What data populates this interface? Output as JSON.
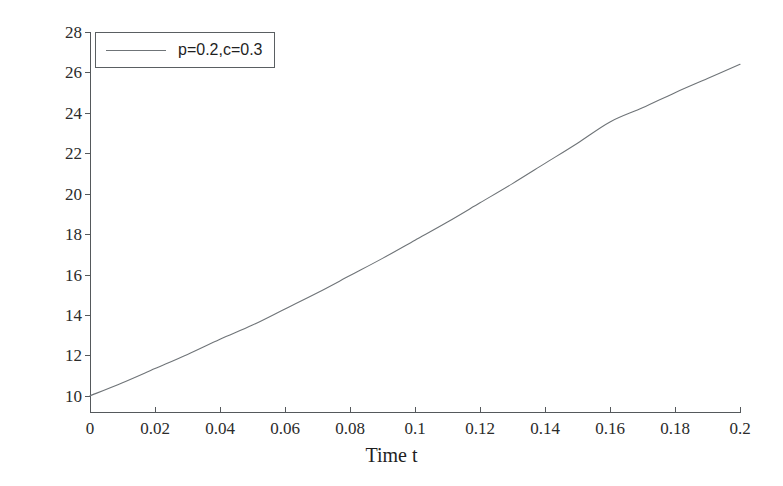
{
  "chart_data": {
    "type": "line",
    "title": "",
    "xlabel": "Time t",
    "ylabel": "Reputation Query",
    "xlim": [
      0,
      0.2
    ],
    "ylim": [
      9.2,
      28
    ],
    "xticks": [
      "0",
      "0.02",
      "0.04",
      "0.06",
      "0.08",
      "0.1",
      "0.12",
      "0.14",
      "0.16",
      "0.18",
      "0.2"
    ],
    "xtick_values": [
      0,
      0.02,
      0.04,
      0.06,
      0.08,
      0.1,
      0.12,
      0.14,
      0.16,
      0.18,
      0.2
    ],
    "yticks": [
      "10",
      "12",
      "14",
      "16",
      "18",
      "20",
      "22",
      "24",
      "26",
      "28"
    ],
    "ytick_values": [
      10,
      12,
      14,
      16,
      18,
      20,
      22,
      24,
      26,
      28
    ],
    "grid": false,
    "legend_position": "top-left",
    "legend_entries": [
      "p=0.2,c=0.3"
    ],
    "line_color": "#6f7478",
    "axis_color": "#55595c",
    "background_color": "#ffffff",
    "series": [
      {
        "name": "p=0.2,c=0.3",
        "x": [
          0,
          0.01,
          0.02,
          0.03,
          0.04,
          0.05,
          0.06,
          0.07,
          0.08,
          0.09,
          0.1,
          0.11,
          0.12,
          0.13,
          0.14,
          0.15,
          0.16,
          0.17,
          0.18,
          0.19,
          0.2
        ],
        "values": [
          10.0,
          10.65,
          11.35,
          12.05,
          12.8,
          13.5,
          14.3,
          15.1,
          15.95,
          16.8,
          17.7,
          18.6,
          19.55,
          20.5,
          21.5,
          22.5,
          23.55,
          24.25,
          25.0,
          25.7,
          26.4
        ]
      }
    ]
  },
  "legend": {
    "items": [
      {
        "label": "p=0.2,c=0.3"
      }
    ]
  },
  "axes": {
    "x_title": "Time t",
    "y_title": "Reputation Query"
  }
}
